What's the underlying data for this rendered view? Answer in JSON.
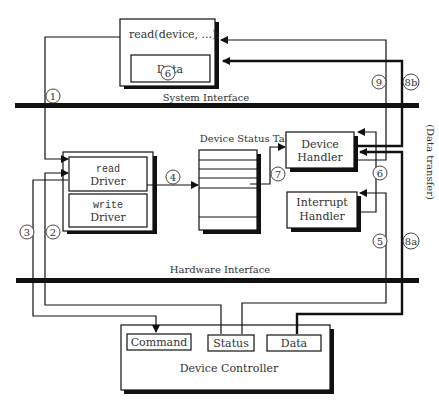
{
  "labels": {
    "read_call": "read(device, ...);",
    "data_top": "Data",
    "system_interface": "System Interface",
    "device_status_table": "Device Status Table",
    "read_driver_kw": "read",
    "read_driver_label": "Driver",
    "write_driver_kw": "write",
    "write_driver_label": "Driver",
    "device_handler_1": "Device",
    "device_handler_2": "Handler",
    "interrupt_handler_1": "Interrupt",
    "interrupt_handler_2": "Handler",
    "hardware_interface": "Hardware Interface",
    "command": "Command",
    "status": "Status",
    "data_bottom": "Data",
    "device_controller": "Device Controller",
    "data_transfer": "(Data transfer)"
  },
  "step_markers": {
    "s1": "1",
    "s2": "2",
    "s3": "3",
    "s4": "4",
    "s5": "5",
    "s6a": "6",
    "s6b": "6",
    "s7": "7",
    "s8a": "8a",
    "s8b": "8b",
    "s9": "9"
  },
  "colors": {
    "line": "#111111",
    "text": "#333333",
    "background": "#ffffff"
  }
}
